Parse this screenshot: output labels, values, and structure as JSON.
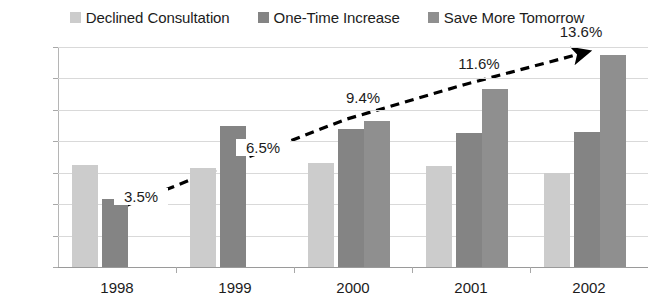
{
  "chart_data": {
    "type": "bar",
    "title": "",
    "xlabel": "",
    "ylabel": "",
    "categories": [
      "1998",
      "1999",
      "2000",
      "2001",
      "2002"
    ],
    "ylim": [
      0,
      14
    ],
    "ytick_values": [
      0,
      2,
      4,
      6,
      8,
      10,
      12,
      14
    ],
    "ytick_labels": [
      "0%",
      "2%",
      "4%",
      "6%",
      "8%",
      "10%",
      "12%",
      "14%"
    ],
    "grid": true,
    "legend_position": "top-center",
    "series": [
      {
        "name": "Declined Consultation",
        "color": "#cccccc",
        "values": [
          6.5,
          6.3,
          6.6,
          6.4,
          6.0
        ]
      },
      {
        "name": "One-Time Increase",
        "color": "#848484",
        "values": [
          4.3,
          9.0,
          8.8,
          8.5,
          8.6
        ]
      },
      {
        "name": "Save More Tomorrow",
        "color": "#8f8f8f",
        "values": [
          null,
          null,
          9.3,
          11.3,
          13.5
        ]
      }
    ],
    "overlay_line": {
      "name": "trend",
      "style": "dashed",
      "color": "#000000",
      "arrow_end": true,
      "x": [
        "1998",
        "1999",
        "2000",
        "2001",
        "2002"
      ],
      "values": [
        3.5,
        6.5,
        9.4,
        11.6,
        13.6
      ],
      "labels": [
        "3.5%",
        "6.5%",
        "9.4%",
        "11.6%",
        "13.6%"
      ]
    }
  },
  "legend": {
    "items": [
      {
        "label": "Declined Consultation",
        "color": "#cccccc"
      },
      {
        "label": "One-Time Increase",
        "color": "#848484"
      },
      {
        "label": "Save More Tomorrow",
        "color": "#8f8f8f"
      }
    ]
  }
}
